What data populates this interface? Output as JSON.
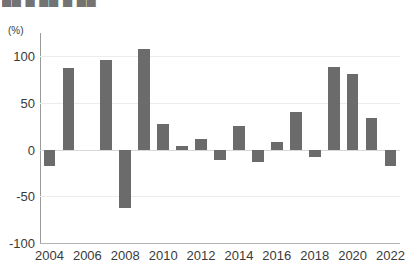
{
  "page": {
    "top_caption": "██ █ ██ █ ██",
    "unit_label": "(%)"
  },
  "chart_data": {
    "type": "bar",
    "title": "",
    "subtitle": "",
    "xlabel": "",
    "ylabel": "(%)",
    "ylim": [
      -100,
      125
    ],
    "yticks": [
      100,
      50,
      0,
      -50,
      -100
    ],
    "ytick_labels": [
      "100",
      "50",
      "0",
      "-50",
      "-100"
    ],
    "grid": true,
    "legend": false,
    "bar_color": "#6b6b6b",
    "categories": [
      "2004",
      "2005",
      "2006",
      "2007",
      "2008",
      "2009",
      "2010",
      "2011",
      "2012",
      "2013",
      "2014",
      "2015",
      "2016",
      "2017",
      "2018",
      "2019",
      "2020",
      "2021",
      "2022"
    ],
    "xtick_labels": [
      "2004",
      "2006",
      "2008",
      "2010",
      "2012",
      "2014",
      "2016",
      "2018",
      "2020",
      "2022"
    ],
    "values": [
      -17,
      87,
      0,
      96,
      -63,
      108,
      27,
      4,
      11,
      -11,
      25,
      -13,
      8,
      40,
      -8,
      89,
      81,
      34,
      -17
    ]
  }
}
